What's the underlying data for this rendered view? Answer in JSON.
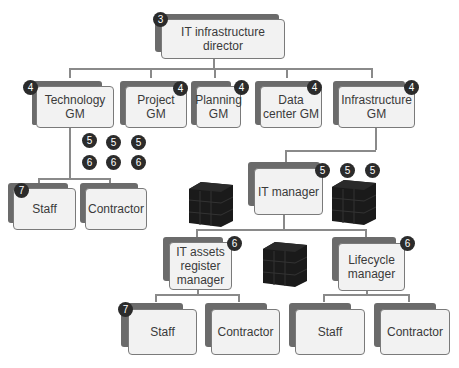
{
  "nodes": {
    "director": {
      "label": "IT infrastructure director",
      "badge": "3"
    },
    "tech_gm": {
      "label": "Technology GM",
      "badge": "4"
    },
    "project_gm": {
      "label": "Project GM",
      "badge": "4"
    },
    "planning_gm": {
      "label": "Planning GM",
      "badge": "4"
    },
    "datacenter_gm": {
      "label": "Data center GM",
      "badge": "4"
    },
    "infra_gm": {
      "label": "Infrastructure GM",
      "badge": "4"
    },
    "staff_1": {
      "label": "Staff",
      "badge": "7"
    },
    "contractor_1": {
      "label": "Contractor"
    },
    "it_manager": {
      "label": "IT manager",
      "badge": "5"
    },
    "assets_manager": {
      "label": "IT assets register manager",
      "badge": "6"
    },
    "lifecycle_manager": {
      "label": "Lifecycle manager",
      "badge": "6"
    },
    "staff_2": {
      "label": "Staff",
      "badge": "7"
    },
    "contractor_2": {
      "label": "Contractor"
    },
    "staff_3": {
      "label": "Staff"
    },
    "contractor_3": {
      "label": "Contractor"
    }
  },
  "loose_badges": {
    "row5": [
      "5",
      "5",
      "5"
    ],
    "row6": [
      "6",
      "6",
      "6"
    ],
    "it_manager_extra": [
      "5",
      "5"
    ]
  }
}
